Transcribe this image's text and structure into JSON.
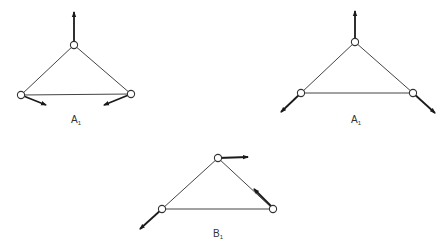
{
  "figures": [
    {
      "id": "left",
      "label_main": "A",
      "label_sub": "1",
      "label_pos": [
        71,
        115
      ],
      "nodes": [
        [
          74,
          45
        ],
        [
          21,
          95
        ],
        [
          131,
          94
        ]
      ],
      "forces": [
        {
          "from": [
            74,
            45
          ],
          "to": [
            74,
            12
          ]
        },
        {
          "from": [
            21,
            95
          ],
          "to": [
            46,
            105
          ]
        },
        {
          "from": [
            131,
            94
          ],
          "to": [
            104,
            105
          ]
        }
      ]
    },
    {
      "id": "right",
      "label_main": "A",
      "label_sub": "1",
      "label_pos": [
        351,
        115
      ],
      "nodes": [
        [
          355,
          42
        ],
        [
          301,
          93
        ],
        [
          413,
          93
        ]
      ],
      "forces": [
        {
          "from": [
            355,
            42
          ],
          "to": [
            355,
            11
          ]
        },
        {
          "from": [
            301,
            93
          ],
          "to": [
            281,
            112
          ]
        },
        {
          "from": [
            413,
            93
          ],
          "to": [
            435,
            113
          ]
        }
      ]
    },
    {
      "id": "bottom",
      "label_main": "B",
      "label_sub": "1",
      "label_pos": [
        213,
        229
      ],
      "nodes": [
        [
          218,
          158
        ],
        [
          162,
          209
        ],
        [
          273,
          209
        ]
      ],
      "forces": [
        {
          "from": [
            218,
            158
          ],
          "to": [
            248,
            157
          ]
        },
        {
          "from": [
            162,
            209
          ],
          "to": [
            140,
            229
          ]
        },
        {
          "from": [
            271,
            206
          ],
          "to": [
            254,
            189
          ]
        }
      ]
    }
  ],
  "caption": ""
}
